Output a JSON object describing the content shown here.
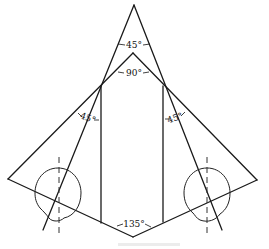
{
  "diagram": {
    "type": "geometric-angle-construction",
    "colors": {
      "stroke": "#1a1a1a",
      "background": "#ffffff",
      "caption": "#d8d8d8"
    },
    "angles": {
      "apex": "45°",
      "inner_apex": "90°",
      "left_side": "45°",
      "right_side": "45°",
      "bottom": "135°"
    },
    "points": {
      "apex": [
        134,
        5
      ],
      "inner_apex": [
        133,
        53
      ],
      "left_joint": [
        101,
        86
      ],
      "right_joint": [
        163,
        86
      ],
      "left_extreme": [
        8,
        179
      ],
      "right_extreme": [
        257,
        180
      ],
      "left_vertical_bottom": [
        101,
        223
      ],
      "right_vertical_bottom": [
        163,
        222
      ],
      "bottom_vertex": [
        133,
        237
      ],
      "left_steep_end": [
        43,
        230
      ],
      "right_steep_end": [
        222,
        230
      ]
    },
    "circles": [
      {
        "name": "left-circle",
        "cx": 58,
        "cy": 193,
        "rx": 23,
        "ry": 25
      },
      {
        "name": "right-circle",
        "cx": 207,
        "cy": 193,
        "rx": 23,
        "ry": 25
      }
    ],
    "centerlines": [
      {
        "name": "left-centerline",
        "x": 59,
        "y1": 157,
        "y2": 233
      },
      {
        "name": "right-centerline",
        "x": 207,
        "y1": 157,
        "y2": 233
      }
    ]
  }
}
